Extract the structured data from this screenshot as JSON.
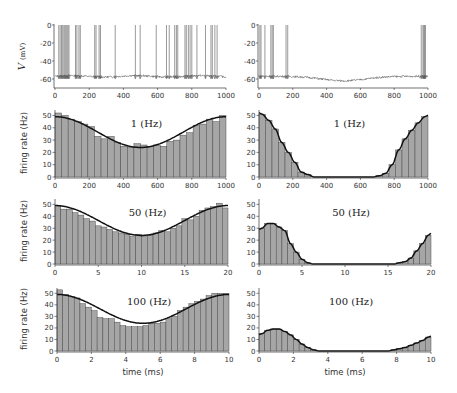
{
  "chart_data": [
    {
      "id": "voltage-left",
      "type": "line",
      "ylabel": "V (mV)",
      "xlabel": "",
      "xlim": [
        0,
        1000
      ],
      "ylim": [
        -70,
        0
      ],
      "xticks": [
        0,
        200,
        400,
        600,
        800,
        1000
      ],
      "yticks": [
        0,
        -20,
        -40,
        -60
      ],
      "resting_potential": -57,
      "spike_times": [
        22,
        30,
        38,
        45,
        52,
        58,
        64,
        70,
        76,
        82,
        120,
        128,
        140,
        148,
        232,
        240,
        258,
        266,
        352,
        470,
        498,
        592,
        652,
        668,
        700,
        710,
        718,
        760,
        768,
        780,
        790,
        800,
        830,
        880,
        912,
        920,
        935,
        948
      ]
    },
    {
      "id": "voltage-right",
      "type": "line",
      "ylabel": "",
      "xlabel": "",
      "xlim": [
        0,
        1000
      ],
      "ylim": [
        -70,
        0
      ],
      "xticks": [
        0,
        200,
        400,
        600,
        800,
        1000
      ],
      "yticks": [
        0,
        -20,
        -40,
        -60
      ],
      "resting_potential": -57,
      "spike_times": [
        5,
        12,
        35,
        70,
        78,
        85,
        160,
        170,
        960,
        970,
        975,
        980,
        985
      ]
    },
    {
      "id": "rate-left-1hz",
      "type": "bar",
      "title": "1 (Hz)",
      "ylabel": "firing rate (Hz)",
      "xlim": [
        0,
        1000
      ],
      "ylim": [
        0,
        55
      ],
      "xticks": [
        0,
        200,
        400,
        600,
        800,
        1000
      ],
      "yticks": [
        0,
        10,
        20,
        30,
        40,
        50
      ],
      "bin_count": 25,
      "values": [
        52,
        50,
        47,
        45,
        43,
        41,
        33,
        31,
        33,
        28,
        25,
        24,
        27,
        26,
        25,
        26,
        25,
        29,
        30,
        34,
        36,
        42,
        43,
        47,
        45,
        50
      ],
      "fit": "cosine",
      "fit_params": {
        "mean": 36.5,
        "amplitude": 12.5,
        "period": 1000,
        "phase": 0
      }
    },
    {
      "id": "rate-right-1hz",
      "type": "bar",
      "title": "1 (Hz)",
      "ylabel": "",
      "xlim": [
        0,
        1000
      ],
      "ylim": [
        0,
        55
      ],
      "xticks": [
        0,
        200,
        400,
        600,
        800,
        1000
      ],
      "yticks": [
        0,
        10,
        20,
        30,
        40,
        50
      ],
      "bin_count": 25,
      "values": [
        51,
        46,
        39,
        28,
        20,
        12,
        4,
        2,
        0,
        0,
        0,
        0,
        0,
        0,
        0,
        0,
        0,
        0,
        1,
        3,
        10,
        22,
        31,
        38,
        44,
        49
      ],
      "fit": "rectified-peak"
    },
    {
      "id": "rate-left-50hz",
      "type": "bar",
      "title": "50 (Hz)",
      "ylabel": "firing rate (Hz)",
      "xlim": [
        0,
        20
      ],
      "ylim": [
        0,
        55
      ],
      "xticks": [
        0,
        5,
        10,
        15,
        20
      ],
      "yticks": [
        0,
        10,
        20,
        30,
        40,
        50
      ],
      "bin_count": 30,
      "values": [
        49,
        46,
        46,
        43,
        41,
        38,
        36,
        32,
        31,
        29,
        27,
        26,
        25,
        23,
        25,
        23,
        24,
        26,
        28,
        27,
        30,
        32,
        38,
        37,
        40,
        45,
        47,
        48,
        51,
        47
      ],
      "fit": "cosine",
      "fit_params": {
        "mean": 36.5,
        "amplitude": 12.5,
        "period": 20,
        "phase": 0
      }
    },
    {
      "id": "rate-right-50hz",
      "type": "bar",
      "title": "50 (Hz)",
      "ylabel": "",
      "xlim": [
        0,
        20
      ],
      "ylim": [
        0,
        55
      ],
      "xticks": [
        0,
        5,
        10,
        15,
        20
      ],
      "yticks": [
        0,
        10,
        20,
        30,
        40,
        50
      ],
      "bin_count": 30,
      "values": [
        30,
        34,
        34,
        31,
        28,
        17,
        10,
        4,
        1,
        0,
        0,
        0,
        0,
        0,
        0,
        0,
        0,
        0,
        0,
        0,
        0,
        0,
        0,
        0,
        1,
        2,
        5,
        11,
        17,
        24
      ],
      "fit": "rectified-peak"
    },
    {
      "id": "rate-left-100hz",
      "type": "bar",
      "title": "100 (Hz)",
      "ylabel": "firing rate (Hz)",
      "xlabel": "time (ms)",
      "xlim": [
        0,
        10
      ],
      "ylim": [
        0,
        55
      ],
      "xticks": [
        0,
        2,
        4,
        6,
        8,
        10
      ],
      "yticks": [
        0,
        10,
        20,
        30,
        40,
        50
      ],
      "bin_count": 30,
      "values": [
        53,
        49,
        47,
        46,
        41,
        38,
        35,
        29,
        28,
        28,
        25,
        22,
        21,
        21,
        21,
        22,
        24,
        24,
        25,
        28,
        30,
        35,
        38,
        41,
        43,
        45,
        48,
        50,
        50,
        50
      ],
      "fit": "cosine",
      "fit_params": {
        "mean": 36.5,
        "amplitude": 12.5,
        "period": 10,
        "phase": 0
      }
    },
    {
      "id": "rate-right-100hz",
      "type": "bar",
      "title": "100 (Hz)",
      "ylabel": "",
      "xlabel": "time (ms)",
      "xlim": [
        0,
        10
      ],
      "ylim": [
        0,
        55
      ],
      "xticks": [
        0,
        2,
        4,
        6,
        8,
        10
      ],
      "yticks": [
        0,
        10,
        20,
        30,
        40,
        50
      ],
      "bin_count": 30,
      "values": [
        15,
        18,
        19,
        19,
        17,
        14,
        10,
        6,
        3,
        1,
        0,
        0,
        0,
        0,
        0,
        0,
        0,
        0,
        0,
        0,
        0,
        0,
        0,
        1,
        2,
        3,
        5,
        7,
        9,
        12
      ],
      "fit": "rectified-peak"
    }
  ],
  "labels": {
    "voltage_ylabel_italic": "V",
    "voltage_ylabel_unit": "(mV)",
    "rate_ylabel": "firing rate (Hz)",
    "time_xlabel": "time (ms)"
  },
  "colors": {
    "bar_fill": "#a6a6a6",
    "bar_edge": "#444444",
    "fit_line": "#111111",
    "trace": "#555555",
    "axis": "#333333"
  }
}
